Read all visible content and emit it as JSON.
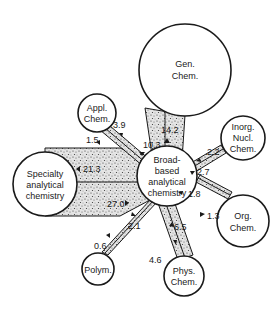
{
  "diagram": {
    "center_node": {
      "id": "broad",
      "lines": [
        "Broad-",
        "based",
        "analytical",
        "chemistry"
      ]
    },
    "nodes": [
      {
        "id": "gen",
        "lines": [
          "Gen.",
          "Chem."
        ]
      },
      {
        "id": "appl",
        "lines": [
          "Appl.",
          "Chem."
        ]
      },
      {
        "id": "inorg",
        "lines": [
          "Inorg.",
          "Nucl.",
          "Chem."
        ]
      },
      {
        "id": "specialty",
        "lines": [
          "Specialty",
          "analytical",
          "chemistry"
        ]
      },
      {
        "id": "org",
        "lines": [
          "Org.",
          "Chem."
        ]
      },
      {
        "id": "polym",
        "lines": [
          "Polym."
        ]
      },
      {
        "id": "phys",
        "lines": [
          "Phys.",
          "Chem."
        ]
      }
    ],
    "flows": [
      {
        "between": "broad-gen",
        "to_center": "10.3",
        "to_node": "14.2"
      },
      {
        "between": "broad-appl",
        "to_center": "3.9",
        "to_node": "1.5"
      },
      {
        "between": "broad-inorg",
        "to_center": "2.2",
        "to_node": "2.7"
      },
      {
        "between": "broad-specialty",
        "to_center": "27.0",
        "to_node": "21.3"
      },
      {
        "between": "broad-org",
        "to_center": "1.3",
        "to_node": "1.8"
      },
      {
        "between": "broad-polym",
        "to_center": "0.6",
        "to_node": "2.1"
      },
      {
        "between": "broad-phys",
        "to_center": "6.5",
        "to_node": "4.6"
      }
    ]
  }
}
